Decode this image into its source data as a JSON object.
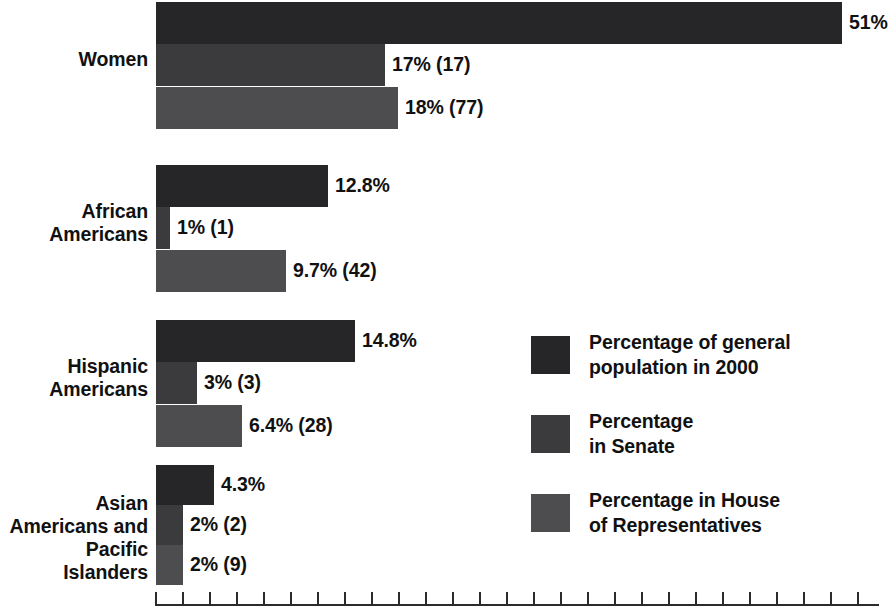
{
  "chart_data": {
    "type": "bar",
    "orientation": "horizontal",
    "title": "",
    "subtitle": "",
    "xlabel": "",
    "ylabel": "",
    "grid": false,
    "xlim": [
      0,
      54
    ],
    "axis": {
      "tick_count": 27,
      "tick_step_percent": 2,
      "tick_labels_shown": false,
      "line_color": "#2b2b2b"
    },
    "legend_position": "center-right",
    "categories": [
      "Women",
      "African\nAmericans",
      "Hispanic\nAmericans",
      "Asian\nAmericans and\nPacific Islanders"
    ],
    "series": [
      {
        "name": "Percentage of general population in 2000",
        "color": "#262628",
        "values": [
          51,
          12.8,
          14.8,
          4.3
        ],
        "labels": [
          "51%",
          "12.8%",
          "14.8%",
          "4.3%"
        ]
      },
      {
        "name": "Percentage in Senate",
        "color": "#3b3b3d",
        "values": [
          17,
          1,
          3,
          2
        ],
        "counts": [
          17,
          1,
          3,
          2
        ],
        "labels": [
          "17% (17)",
          "1% (1)",
          "3% (3)",
          "2% (2)"
        ]
      },
      {
        "name": "Percentage in House of Representatives",
        "color": "#4d4d4f",
        "values": [
          18,
          9.7,
          6.4,
          2
        ],
        "counts": [
          77,
          42,
          28,
          9
        ],
        "labels": [
          "18% (77)",
          "9.7% (42)",
          "6.4% (28)",
          "2% (9)"
        ]
      }
    ]
  },
  "legend": {
    "items": [
      {
        "label": "Percentage of general\npopulation in 2000",
        "color": "#262628"
      },
      {
        "label": "Percentage\nin Senate",
        "color": "#3b3b3d"
      },
      {
        "label": "Percentage in House\nof Representatives",
        "color": "#4d4d4f"
      }
    ]
  },
  "colors": {
    "background": "#ffffff",
    "text": "#111111",
    "series0": "#262628",
    "series1": "#3b3b3d",
    "series2": "#4d4d4f",
    "axis": "#2b2b2b"
  },
  "cat_labels": {
    "women": "Women",
    "african": "African\nAmericans",
    "hispanic": "Hispanic\nAmericans",
    "asian": "Asian\nAmericans and\nPacific Islanders"
  },
  "values": {
    "g0s0": "51%",
    "g0s1": "17% (17)",
    "g0s2": "18% (77)",
    "g1s0": "12.8%",
    "g1s1": "1% (1)",
    "g1s2": "9.7% (42)",
    "g2s0": "14.8%",
    "g2s1": "3% (3)",
    "g2s2": "6.4% (28)",
    "g3s0": "4.3%",
    "g3s1": "2% (2)",
    "g3s2": "2% (9)"
  }
}
